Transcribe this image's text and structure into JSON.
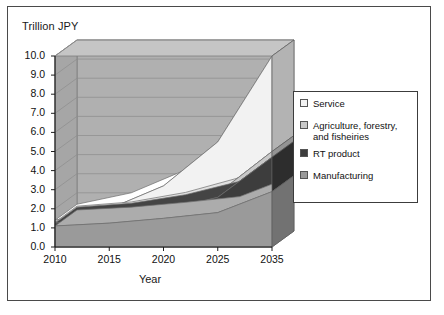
{
  "figure": {
    "y_axis_title": "Trillion JPY",
    "x_axis_title": "Year"
  },
  "legend": {
    "items": [
      {
        "label": "Service",
        "color": "#f2f2f2",
        "name": "legend-item-service"
      },
      {
        "label": "Agriculture, forestry, and fisheiries",
        "color": "#c8c8c8",
        "name": "legend-item-agriculture"
      },
      {
        "label": "RT product",
        "color": "#3d3d3d",
        "name": "legend-item-rt-product"
      },
      {
        "label": "Manufacturing",
        "color": "#9a9a9a",
        "name": "legend-item-manufacturing"
      }
    ]
  },
  "chart_data": {
    "type": "area",
    "title": "",
    "subtitle": "",
    "xlabel": "Year",
    "ylabel": "Trillion JPY",
    "stacked": true,
    "three_d": true,
    "grid": true,
    "legend_position": "right",
    "x": [
      2010,
      2015,
      2020,
      2025,
      2035
    ],
    "categories": [
      "2010",
      "2015",
      "2020",
      "2025",
      "2035"
    ],
    "xtick_labels": [
      "2010",
      "2015",
      "2020",
      "2025",
      "2035"
    ],
    "ytick_labels": [
      "0.0",
      "1.0",
      "2.0",
      "3.0",
      "4.0",
      "5.0",
      "6.0",
      "7.0",
      "8.0",
      "9.0",
      "10.0"
    ],
    "ytick_values": [
      0.0,
      1.0,
      2.0,
      3.0,
      4.0,
      5.0,
      6.0,
      7.0,
      8.0,
      9.0,
      10.0
    ],
    "ylim": [
      0.0,
      10.0
    ],
    "series": [
      {
        "name": "Manufacturing",
        "values": [
          1.1,
          1.25,
          1.5,
          1.8,
          2.9
        ],
        "color": "#9a9a9a"
      },
      {
        "name": "RT product",
        "values": [
          0.15,
          0.2,
          0.4,
          0.8,
          1.8
        ],
        "color": "#3d3d3d"
      },
      {
        "name": "Agriculture, forestry, and fisheiries",
        "values": [
          0.05,
          0.07,
          0.12,
          0.2,
          0.3
        ],
        "color": "#c8c8c8"
      },
      {
        "name": "Service",
        "values": [
          0.1,
          0.48,
          1.18,
          2.7,
          5.0
        ],
        "color": "#f2f2f2"
      }
    ],
    "totals": [
      1.4,
      2.0,
      3.2,
      5.5,
      10.0
    ]
  },
  "colors": {
    "plot_background": "#b0b0b0",
    "top_face": "#c5c5c5",
    "side_face": "#8f8f8f",
    "border": "#4a4a4a",
    "text": "#111111"
  }
}
